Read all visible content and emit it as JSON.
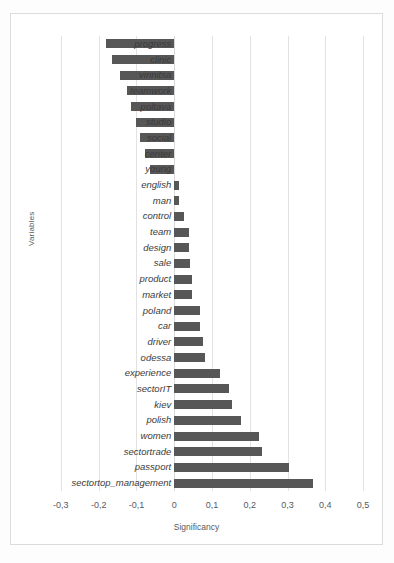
{
  "chart_data": {
    "type": "bar",
    "orientation": "horizontal",
    "title": "",
    "xlabel": "Significancy",
    "ylabel": "Variables",
    "xlim": [
      -0.35,
      0.55
    ],
    "grid": true,
    "legend": false,
    "bar_color": "#575757",
    "xticks": [
      "-0,3",
      "-0,2",
      "-0,1",
      "0",
      "0,1",
      "0,2",
      "0,3",
      "0,4",
      "0,5"
    ],
    "xtick_values": [
      -0.3,
      -0.2,
      -0.1,
      0,
      0.1,
      0.2,
      0.3,
      0.4,
      0.5
    ],
    "categories": [
      "progress",
      "clinic",
      "vinnitsa",
      "teamwork",
      "poltava",
      "studio",
      "social",
      "center",
      "young",
      "english",
      "man",
      "control",
      "team",
      "design",
      "sale",
      "product",
      "market",
      "poland",
      "car",
      "driver",
      "odessa",
      "experience",
      "sectorIT",
      "kiev",
      "polish",
      "women",
      "sectortrade",
      "passport",
      "sectortop_management"
    ],
    "values": [
      -0.18,
      -0.165,
      -0.143,
      -0.125,
      -0.115,
      -0.1,
      -0.09,
      -0.078,
      -0.065,
      0.012,
      0.012,
      0.027,
      0.038,
      0.04,
      0.043,
      0.046,
      0.046,
      0.067,
      0.068,
      0.077,
      0.082,
      0.12,
      0.145,
      0.152,
      0.178,
      0.225,
      0.232,
      0.305,
      0.368
    ]
  }
}
